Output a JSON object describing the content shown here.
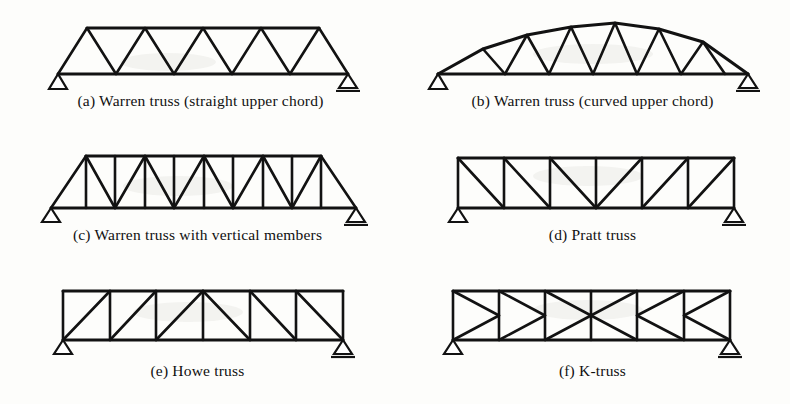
{
  "figure": {
    "background_color": "#fdfdfb",
    "ink_color": "#121212",
    "panel_count": 6
  },
  "panels": [
    {
      "id": "a",
      "caption": "(a) Warren truss (straight upper chord)",
      "truss_type": "warren-straight",
      "supports": [
        "pin",
        "roller"
      ],
      "top_nodes": 5,
      "bottom_nodes": 6,
      "bays": 10,
      "has_verticals": false,
      "chord_shape": "straight"
    },
    {
      "id": "b",
      "caption": "(b) Warren truss (curved upper chord)",
      "truss_type": "warren-curved",
      "supports": [
        "pin",
        "roller"
      ],
      "top_nodes": 7,
      "bottom_nodes": 8,
      "bays": 12,
      "has_verticals": false,
      "chord_shape": "curved"
    },
    {
      "id": "c",
      "caption": "(c) Warren truss with vertical members",
      "truss_type": "warren-vertical",
      "supports": [
        "pin",
        "roller"
      ],
      "top_nodes": 9,
      "bottom_nodes": 6,
      "bays": 8,
      "has_verticals": true,
      "chord_shape": "straight"
    },
    {
      "id": "d",
      "caption": "(d) Pratt truss",
      "truss_type": "pratt",
      "supports": [
        "pin",
        "roller"
      ],
      "top_nodes": 7,
      "bottom_nodes": 7,
      "bays": 6,
      "has_verticals": true,
      "chord_shape": "straight",
      "diagonal_direction": "descending-to-center"
    },
    {
      "id": "e",
      "caption": "(e) Howe truss",
      "truss_type": "howe",
      "supports": [
        "pin",
        "roller"
      ],
      "top_nodes": 7,
      "bottom_nodes": 7,
      "bays": 6,
      "has_verticals": true,
      "chord_shape": "straight",
      "diagonal_direction": "ascending-to-center"
    },
    {
      "id": "f",
      "caption": "(f) K-truss",
      "truss_type": "k-truss",
      "supports": [
        "pin",
        "roller"
      ],
      "top_nodes": 7,
      "bottom_nodes": 7,
      "bays": 6,
      "has_verticals": true,
      "chord_shape": "straight",
      "diagonal_direction": "k-pattern-mid-height"
    }
  ],
  "legend": {
    "pin_support_label": "pin support",
    "roller_support_label": "roller support"
  }
}
